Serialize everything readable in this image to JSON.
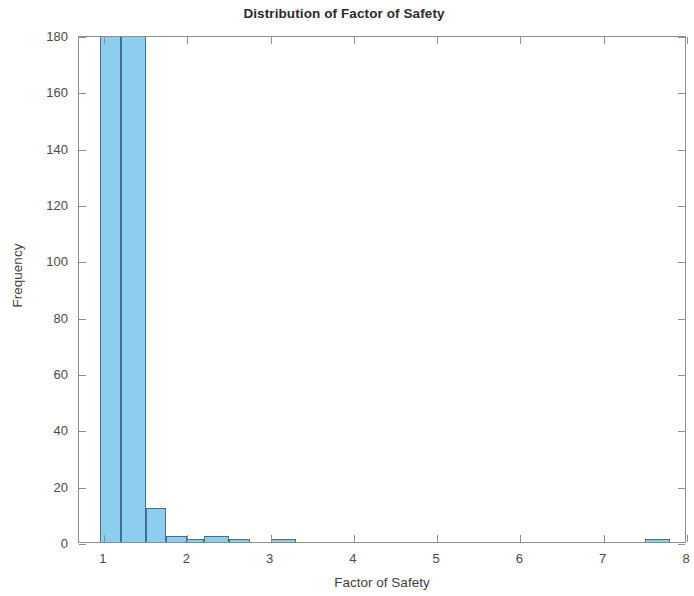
{
  "chart_data": {
    "type": "bar",
    "title": "Distribution of Factor of Safety",
    "xlabel": "Factor of Safety",
    "ylabel": "Frequency",
    "xlim": [
      0.7,
      8.0
    ],
    "ylim": [
      0,
      180
    ],
    "grid": false,
    "legend": null,
    "bar_color": "#8dcdee",
    "bar_edge_color": "#3f6f94",
    "note": "Histogram; tallest bin is clipped at the top of the y-axis (value exceeds 180).",
    "xticks": [
      1,
      2,
      3,
      4,
      5,
      6,
      7,
      8
    ],
    "xtick_labels": [
      "1",
      "2",
      "3",
      "4",
      "5",
      "6",
      "7",
      "8"
    ],
    "yticks": [
      0,
      20,
      40,
      60,
      80,
      100,
      120,
      140,
      160,
      180
    ],
    "ytick_labels": [
      "0",
      "20",
      "40",
      "60",
      "80",
      "100",
      "120",
      "140",
      "160",
      "180"
    ],
    "bin_width": 0.25,
    "bins": [
      {
        "x0": 0.95,
        "x1": 1.2,
        "value": 180
      },
      {
        "x0": 1.2,
        "x1": 1.5,
        "value": 180
      },
      {
        "x0": 1.5,
        "x1": 1.75,
        "value": 12
      },
      {
        "x0": 1.75,
        "x1": 2.0,
        "value": 2
      },
      {
        "x0": 2.0,
        "x1": 2.2,
        "value": 1
      },
      {
        "x0": 2.2,
        "x1": 2.5,
        "value": 2
      },
      {
        "x0": 2.5,
        "x1": 2.75,
        "value": 1
      },
      {
        "x0": 3.0,
        "x1": 3.3,
        "value": 1
      },
      {
        "x0": 7.5,
        "x1": 7.8,
        "value": 1
      }
    ],
    "categories": [
      "0.95-1.20",
      "1.20-1.50",
      "1.50-1.75",
      "1.75-2.00",
      "2.00-2.20",
      "2.20-2.50",
      "2.50-2.75",
      "3.00-3.30",
      "7.50-7.80"
    ],
    "values": [
      180,
      180,
      12,
      2,
      1,
      2,
      1,
      1,
      1
    ]
  }
}
